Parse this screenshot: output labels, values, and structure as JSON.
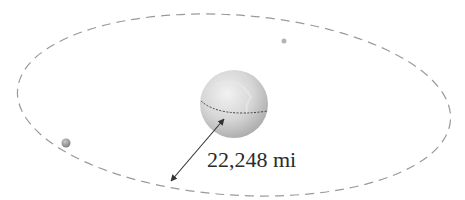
{
  "diagram": {
    "type": "orbit",
    "distance_label": "22,248 mi",
    "elements": {
      "orbit": {
        "shape": "ellipse",
        "style": "dashed",
        "color": "#9a9a9a"
      },
      "planet": {
        "shape": "sphere",
        "color": "#d4d4d4",
        "equator_style": "dashed"
      },
      "satellites": [
        {
          "name": "satellite-left",
          "color": "#8a8a8a"
        },
        {
          "name": "satellite-top",
          "color": "#b0b0b0"
        }
      ],
      "arrow": {
        "type": "double-headed",
        "color": "#333333",
        "measures": "distance from planet surface to orbit"
      }
    }
  }
}
